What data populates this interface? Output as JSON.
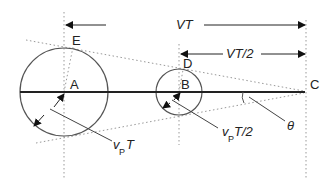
{
  "diagram": {
    "points": {
      "A": "A",
      "B": "B",
      "C": "C",
      "D": "D",
      "E": "E"
    },
    "distance_labels": {
      "full": "VT",
      "half": "VT/2"
    },
    "radius_labels": {
      "large_v": "v",
      "large_sub": "P",
      "large_rest": "T",
      "small_v": "v",
      "small_sub": "P",
      "small_rest": "T/2"
    },
    "angle_label": "θ",
    "colors": {
      "line": "#222222",
      "dotted": "#888888",
      "circle": "#555555"
    }
  }
}
